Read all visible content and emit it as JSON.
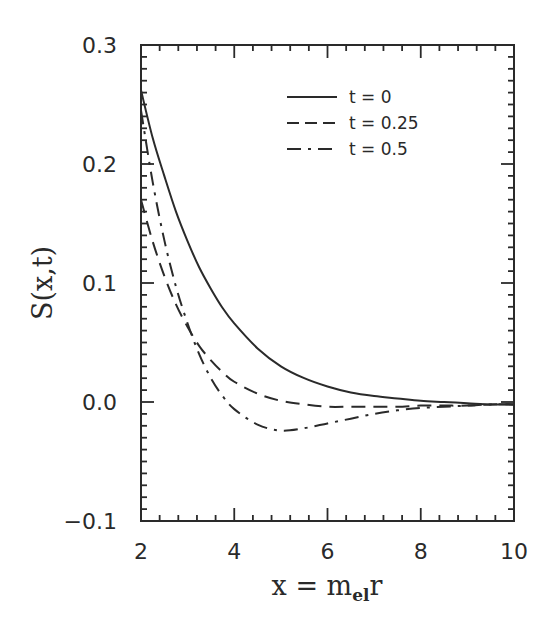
{
  "chart_data": {
    "type": "line",
    "title": "",
    "xlabel": "x = m_el r",
    "xlabel_parts": {
      "main": "x = m",
      "sub": "el",
      "tail": "r"
    },
    "ylabel": "S(x,t)",
    "xlim": [
      2,
      10
    ],
    "ylim": [
      -0.1,
      0.3
    ],
    "xticks": [
      2,
      4,
      6,
      8,
      10
    ],
    "xtick_labels": [
      "2",
      "4",
      "6",
      "8",
      "10"
    ],
    "yticks": [
      -0.1,
      0.0,
      0.1,
      0.2,
      0.3
    ],
    "ytick_labels": [
      "−0.1",
      "0.0",
      "0.1",
      "0.2",
      "0.3"
    ],
    "x_minor_step": 0.4,
    "y_minor_step": 0.01,
    "grid": false,
    "legend_position": "upper right",
    "x": [
      2.0,
      2.25,
      2.5,
      2.75,
      3.0,
      3.25,
      3.5,
      3.75,
      4.0,
      4.5,
      5.0,
      5.5,
      6.0,
      6.5,
      7.0,
      7.5,
      8.0,
      8.5,
      9.0,
      9.5,
      10.0
    ],
    "series": [
      {
        "name": "t = 0",
        "style": "solid",
        "values": [
          0.262,
          0.222,
          0.19,
          0.16,
          0.135,
          0.113,
          0.095,
          0.079,
          0.066,
          0.045,
          0.03,
          0.02,
          0.013,
          0.008,
          0.005,
          0.003,
          0.001,
          0.0,
          -0.001,
          -0.002,
          -0.002
        ]
      },
      {
        "name": "t = 0.25",
        "style": "dashed",
        "values": [
          0.17,
          0.135,
          0.106,
          0.082,
          0.063,
          0.047,
          0.035,
          0.025,
          0.017,
          0.007,
          0.001,
          -0.002,
          -0.004,
          -0.004,
          -0.004,
          -0.004,
          -0.003,
          -0.003,
          -0.003,
          -0.002,
          -0.002
        ]
      },
      {
        "name": "t = 0.5",
        "style": "dashdot",
        "values": [
          0.245,
          0.185,
          0.136,
          0.097,
          0.066,
          0.04,
          0.02,
          0.005,
          -0.006,
          -0.019,
          -0.024,
          -0.022,
          -0.018,
          -0.014,
          -0.01,
          -0.007,
          -0.005,
          -0.004,
          -0.003,
          -0.002,
          -0.002
        ]
      }
    ]
  },
  "colors": {
    "ink": "#2a2a2a",
    "background": "#ffffff"
  }
}
